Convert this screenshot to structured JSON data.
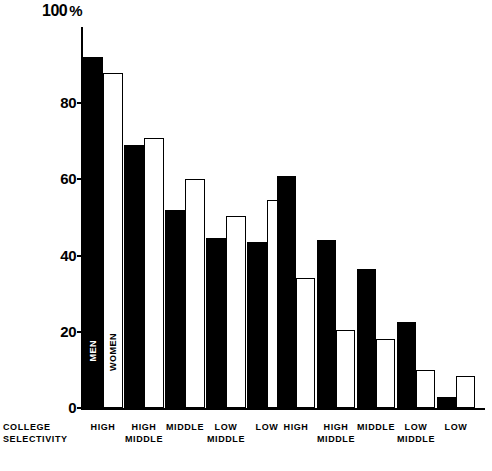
{
  "chart_data": {
    "type": "bar",
    "title": "",
    "xlabel": "COLLEGE SELECTIVITY",
    "ylabel": "%",
    "ylim": [
      0,
      100
    ],
    "ytick_labels": [
      "100",
      "80",
      "60",
      "40",
      "20",
      "0"
    ],
    "ytick_values": [
      100,
      80,
      60,
      40,
      20,
      0
    ],
    "grid": false,
    "legend_position": "in-first-bars",
    "series": [
      {
        "name": "MEN",
        "color": "#000000",
        "style": "filled"
      },
      {
        "name": "WOMEN",
        "color": "#ffffff",
        "style": "outlined"
      }
    ],
    "panels": [
      {
        "name": "left-panel",
        "categories": [
          "HIGH",
          "HIGH\nMIDDLE",
          "MIDDLE",
          "LOW\nMIDDLE",
          "LOW"
        ],
        "series": [
          {
            "name": "MEN",
            "values": [
              92,
              69,
              52,
              44.5,
              43.5
            ]
          },
          {
            "name": "WOMEN",
            "values": [
              88,
              71,
              60,
              50.5,
              54.5
            ]
          }
        ]
      },
      {
        "name": "right-panel",
        "categories": [
          "HIGH",
          "HIGH\nMIDDLE",
          "MIDDLE",
          "LOW\nMIDDLE",
          "LOW"
        ],
        "series": [
          {
            "name": "MEN",
            "values": [
              61,
              44,
              36.5,
              22.5,
              3
            ]
          },
          {
            "name": "WOMEN",
            "values": [
              34,
              20.5,
              18,
              10,
              8.5
            ]
          }
        ]
      }
    ]
  },
  "axis": {
    "y_top_number": "100",
    "y_percent_symbol": "%",
    "ticks": [
      {
        "label": "80",
        "value": 80
      },
      {
        "label": "60",
        "value": 60
      },
      {
        "label": "40",
        "value": 40
      },
      {
        "label": "20",
        "value": 20
      },
      {
        "label": "0",
        "value": 0
      }
    ],
    "x_title_line1": "COLLEGE",
    "x_title_line2": "SELECTIVITY"
  },
  "series_tags": {
    "men": "MEN",
    "women": "WOMEN"
  },
  "categories": {
    "left": [
      {
        "line1": "HIGH",
        "line2": ""
      },
      {
        "line1": "HIGH",
        "line2": "MIDDLE"
      },
      {
        "line1": "MIDDLE",
        "line2": ""
      },
      {
        "line1": "LOW",
        "line2": "MIDDLE"
      },
      {
        "line1": "LOW",
        "line2": ""
      }
    ],
    "right": [
      {
        "line1": "HIGH",
        "line2": ""
      },
      {
        "line1": "HIGH",
        "line2": "MIDDLE"
      },
      {
        "line1": "MIDDLE",
        "line2": ""
      },
      {
        "line1": "LOW",
        "line2": "MIDDLE"
      },
      {
        "line1": "LOW",
        "line2": ""
      }
    ]
  },
  "colors": {
    "men_fill": "#000000",
    "women_fill": "#ffffff",
    "stroke": "#000000",
    "background": "#ffffff"
  }
}
